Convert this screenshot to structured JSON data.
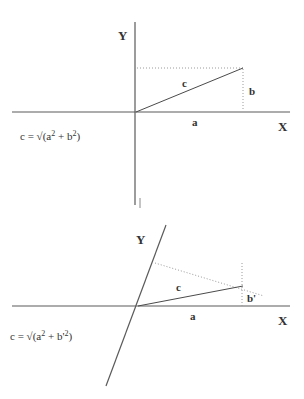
{
  "page": {
    "background_color": "#ffffff",
    "width": 304,
    "height": 399
  },
  "colors": {
    "axis": "#5a5a5a",
    "solid": "#4a4a4a",
    "dotted": "#9a9a9a",
    "text": "#333333"
  },
  "figures": [
    {
      "id": "orthogonal-axes-figure",
      "name": "orthogonal-axes",
      "axis_x_label": "X",
      "axis_y_label": "Y",
      "hypotenuse_label": "c",
      "base_label": "a",
      "height_label": "b",
      "formula": {
        "lhs": "c = ",
        "radical": "√",
        "open": "(",
        "term1_base": "a",
        "term1_exp": "2",
        "plus": " + ",
        "term2_base": "b",
        "term2_exp": "2",
        "close": ")",
        "full_text": "c = √(a2 + b2)"
      },
      "geometry": {
        "origin": [
          135,
          112
        ],
        "vertex": [
          243,
          68
        ],
        "x_axis": [
          12,
          112,
          290,
          112
        ],
        "y_axis": [
          135,
          22,
          135,
          205
        ],
        "y_axis_angle_deg": 90
      }
    },
    {
      "id": "oblique-axes-figure",
      "name": "oblique-axes",
      "axis_x_label": "X",
      "axis_y_label": "Y",
      "hypotenuse_label": "c",
      "base_label": "a",
      "height_label": "b'",
      "formula": {
        "lhs": "c = ",
        "radical": "√",
        "open": "(",
        "term1_base": "a",
        "term1_exp": "2",
        "plus": " + ",
        "term2_base": "b'",
        "term2_exp": "2",
        "close": ")",
        "full_text": "c = √(a2 + b'2)"
      },
      "geometry": {
        "origin": [
          137,
          306
        ],
        "vertex": [
          242,
          286
        ],
        "x_axis": [
          12,
          306,
          290,
          306
        ],
        "y_axis": [
          166,
          225,
          106,
          386
        ],
        "y_axis_angle_deg": 110
      }
    }
  ]
}
